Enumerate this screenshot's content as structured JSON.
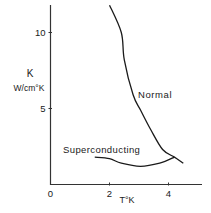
{
  "chart_data": {
    "type": "line",
    "title": "",
    "xlabel": "T°K",
    "ylabel_line1": "K",
    "ylabel_line2": "W/cm°K",
    "xlim": [
      0,
      5.1
    ],
    "ylim": [
      0,
      11.8
    ],
    "x_ticks": [
      {
        "value": 0,
        "label": "0"
      },
      {
        "value": 2,
        "label": "2"
      },
      {
        "value": 4,
        "label": "4"
      }
    ],
    "y_ticks": [
      {
        "value": 5,
        "label": "5"
      },
      {
        "value": 10,
        "label": "10"
      }
    ],
    "grid": false,
    "legend": "none (curves labeled inline)",
    "series": [
      {
        "name": "Normal",
        "x": [
          2.0,
          2.4,
          2.5,
          2.8,
          3.05,
          3.4,
          3.8,
          4.2,
          4.5
        ],
        "y": [
          11.8,
          10.0,
          8.2,
          5.9,
          4.9,
          3.6,
          2.3,
          1.8,
          1.4
        ]
      },
      {
        "name": "Superconducting",
        "x": [
          1.5,
          2.0,
          2.4,
          3.05,
          3.7,
          4.2
        ],
        "y": [
          1.8,
          1.7,
          1.4,
          1.2,
          1.4,
          1.8
        ]
      }
    ],
    "annotations": [
      {
        "text": "Normal",
        "x": 3.0,
        "y": 6.0
      },
      {
        "text": "Superconducting",
        "x": 0.45,
        "y": 2.3
      }
    ]
  }
}
